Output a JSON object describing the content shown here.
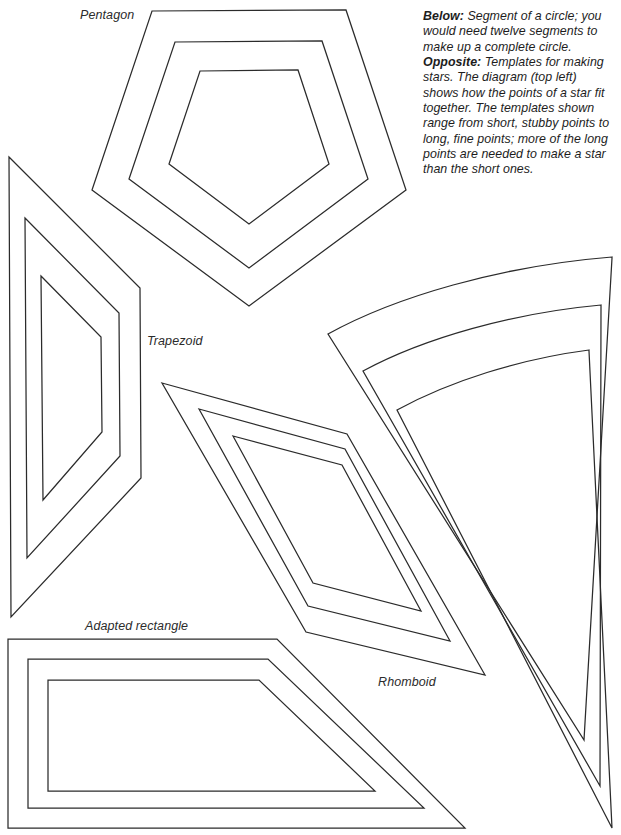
{
  "page": {
    "background_color": "#ffffff",
    "ink_color": "#2b2b2b",
    "width": 621,
    "height": 835
  },
  "labels": {
    "pentagon": "Pentagon",
    "trapezoid": "Trapezoid",
    "adapted_rectangle": "Adapted rectangle",
    "rhomboid": "Rhomboid"
  },
  "caption": {
    "below_lead": "Below:",
    "below_text": " Segment of a circle; you would need twelve segments to make up a complete circle.",
    "opposite_lead": "Opposite:",
    "opposite_text": " Templates for making stars. The diagram (top left) shows how the points of a star fit together. The templates shown range from short, stubby points to long, fine points; more of the long points are needed to make a star than the short ones."
  },
  "chart_data": {
    "type": "diagram",
    "shapes": [
      {
        "name": "pentagon",
        "label": "Pentagon",
        "nested_outlines": 3,
        "outlines": [
          "M 152 11 L 346 10 L 406 190 L 249 306 L 92 190 Z",
          "M 175 42 L 322 41 L 368 179 L 249 268 L 129 179 Z",
          "M 200 71 L 298 70 L 329 164 L 249 224 L 169 164 Z"
        ]
      },
      {
        "name": "trapezoid",
        "label": "Trapezoid",
        "nested_outlines": 3,
        "outlines": [
          "M 9 157 L 140 288 L 141 478 L 11 617 Z",
          "M 25 218 L 119 313 L 120 456 L 27 558 Z",
          "M 41 276 L 101 337 L 102 432 L 43 500 Z"
        ]
      },
      {
        "name": "rhomboid",
        "label": "Rhomboid",
        "nested_outlines": 3,
        "outlines": [
          "M 162 383 L 347 434 L 485 675 L 306 632 Z",
          "M 199 409 L 345 449 L 450 641 L 308 606 Z",
          "M 233 436 L 342 465 L 421 611 L 313 583 Z"
        ]
      },
      {
        "name": "circle-segment",
        "label": "Segment of a circle",
        "nested_outlines": 3,
        "description": "Wedge with curved outer arc and pointed tip; twelve make a full circle.",
        "outlines": [
          "M 612 258 L 326 335 A 372 372 0 0 1 612 258 Z",
          "M 601 305 L 363 372 A 312 312 0 0 1 601 305 Z",
          "M 589 350 L 398 411 A 250 250 0 0 1 589 350 Z"
        ]
      },
      {
        "name": "adapted-rectangle",
        "label": "Adapted rectangle",
        "nested_outlines": 3,
        "outlines": [
          "M 8 639 L 277 639 L 465 828 L 8 828 Z",
          "M 28 659 L 268 659 L 424 808 L 28 808 Z",
          "M 48 680 L 259 680 L 375 791 L 48 791 Z"
        ]
      }
    ]
  }
}
